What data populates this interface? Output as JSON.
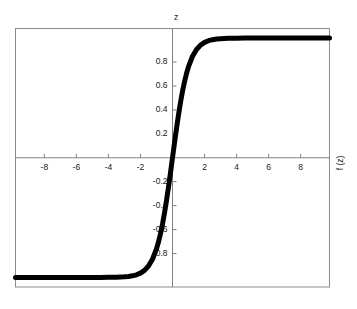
{
  "chart_data": {
    "type": "line",
    "title": "z",
    "xlabel": "",
    "ylabel": "f (z)",
    "xlim": [
      -9.8,
      9.8
    ],
    "ylim": [
      -1.08,
      1.08
    ],
    "grid": false,
    "legend": null,
    "xticks": [
      -8,
      -6,
      -4,
      -2,
      2,
      4,
      6,
      8
    ],
    "xtick_labels": [
      "-8",
      "-6",
      "-4",
      "-2",
      "2",
      "4",
      "6",
      "8"
    ],
    "yticks": [
      0.8,
      0.6,
      0.4,
      0.2,
      -0.2,
      -0.4,
      -0.6,
      -0.8
    ],
    "ytick_labels": [
      "0.8",
      "0.6",
      "0.4",
      "0.2",
      "-0.2",
      "-0.4",
      "-0.6",
      "-0.8"
    ],
    "series": [
      {
        "name": "tanh(z)",
        "color": "#000000",
        "line_width": 5,
        "x": [
          -9.8,
          -9.0,
          -8.0,
          -7.0,
          -6.0,
          -5.0,
          -4.5,
          -4.0,
          -3.5,
          -3.0,
          -2.75,
          -2.5,
          -2.25,
          -2.0,
          -1.75,
          -1.5,
          -1.25,
          -1.0,
          -0.875,
          -0.75,
          -0.625,
          -0.5,
          -0.375,
          -0.25,
          -0.125,
          0.0,
          0.125,
          0.25,
          0.375,
          0.5,
          0.625,
          0.75,
          0.875,
          1.0,
          1.25,
          1.5,
          1.75,
          2.0,
          2.25,
          2.5,
          2.75,
          3.0,
          3.5,
          4.0,
          4.5,
          5.0,
          6.0,
          7.0,
          8.0,
          9.0,
          9.8
        ],
        "y": [
          -1.0,
          -1.0,
          -1.0,
          -1.0,
          -0.99999,
          -0.9999,
          -0.9998,
          -0.9993,
          -0.9982,
          -0.99505,
          -0.99186,
          -0.98661,
          -0.97803,
          -0.96403,
          -0.94138,
          -0.90515,
          -0.84828,
          -0.76159,
          -0.70404,
          -0.63515,
          -0.55487,
          -0.46212,
          -0.35835,
          -0.24492,
          -0.12435,
          0.0,
          0.12435,
          0.24492,
          0.35835,
          0.46212,
          0.55487,
          0.63515,
          0.70404,
          0.76159,
          0.84828,
          0.90515,
          0.94138,
          0.96403,
          0.97803,
          0.98661,
          0.99186,
          0.99505,
          0.9982,
          0.9993,
          0.9998,
          0.9999,
          0.99999,
          1.0,
          1.0,
          1.0,
          1.0
        ]
      }
    ],
    "axis_color": "#808080",
    "frame_color": "#8c8c8c",
    "background": "#ffffff",
    "zero_lines": {
      "horizontal": 0,
      "vertical": 0
    }
  }
}
